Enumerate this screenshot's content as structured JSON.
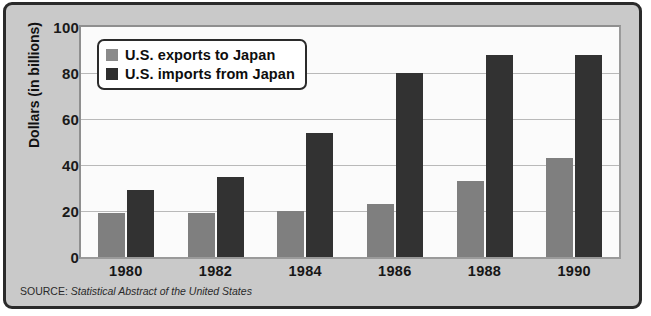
{
  "chart_data": {
    "type": "bar",
    "title": "",
    "xlabel": "",
    "ylabel": "Dollars (in billions)",
    "categories": [
      "1980",
      "1982",
      "1984",
      "1986",
      "1988",
      "1990"
    ],
    "series": [
      {
        "name": "U.S. exports to Japan",
        "values": [
          19,
          19,
          20,
          23,
          33,
          43
        ],
        "color": "#7f7f7f"
      },
      {
        "name": "U.S. imports from Japan",
        "values": [
          29,
          35,
          54,
          80,
          88,
          88
        ],
        "color": "#323232"
      }
    ],
    "ylim": [
      0,
      100
    ],
    "yticks": [
      0,
      20,
      40,
      60,
      80,
      100
    ],
    "grid": true,
    "legend_position": "top-left"
  },
  "legend": {
    "items": [
      {
        "label": "U.S. exports to Japan"
      },
      {
        "label": "U.S. imports from Japan"
      }
    ]
  },
  "source": {
    "label": "SOURCE:",
    "title": "Statistical Abstract of the United States"
  },
  "colors": {
    "exports_bar": "#7f7f7f",
    "imports_bar": "#323232",
    "background": "#c9c9c9",
    "plot_background": "#fbfbfb",
    "frame": "#2a2a2a",
    "gridline": "#b9b9b9"
  }
}
